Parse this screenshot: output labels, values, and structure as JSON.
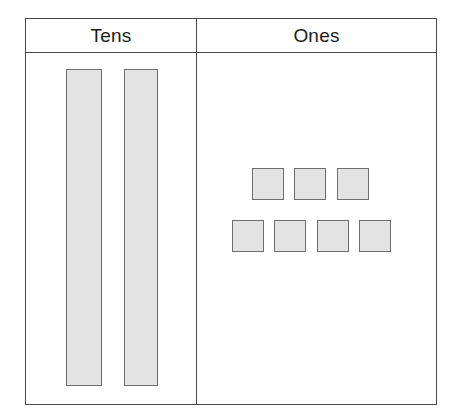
{
  "chart_data": {
    "type": "table",
    "categories": [
      "Tens",
      "Ones"
    ],
    "values": [
      2,
      7
    ],
    "represented_number": 27,
    "xlabel": "",
    "ylabel": "",
    "grid": true,
    "legend": "none",
    "annotations": [
      "2 tens rods shown in the Tens column",
      "7 unit squares shown in the Ones column, arranged 3 on top and 4 below"
    ]
  },
  "chart": {
    "columns": [
      {
        "key": "tens",
        "header": "Tens",
        "count": 2,
        "block_type": "rod",
        "blocks": [
          {
            "label": "ten-rod-1"
          },
          {
            "label": "ten-rod-2"
          }
        ]
      },
      {
        "key": "ones",
        "header": "Ones",
        "count": 7,
        "block_type": "unit",
        "rows": [
          {
            "label": "ones-row-top",
            "count": 3,
            "blocks": [
              {
                "label": "one-unit-1"
              },
              {
                "label": "one-unit-2"
              },
              {
                "label": "one-unit-3"
              }
            ]
          },
          {
            "label": "ones-row-bottom",
            "count": 4,
            "blocks": [
              {
                "label": "one-unit-4"
              },
              {
                "label": "one-unit-5"
              },
              {
                "label": "one-unit-6"
              },
              {
                "label": "one-unit-7"
              }
            ]
          }
        ]
      }
    ]
  },
  "colors": {
    "block_fill": "#e3e3e3",
    "block_border": "#6e6e6e",
    "table_border": "#4a4a4a",
    "text": "#1c1c1c",
    "background": "#ffffff"
  }
}
